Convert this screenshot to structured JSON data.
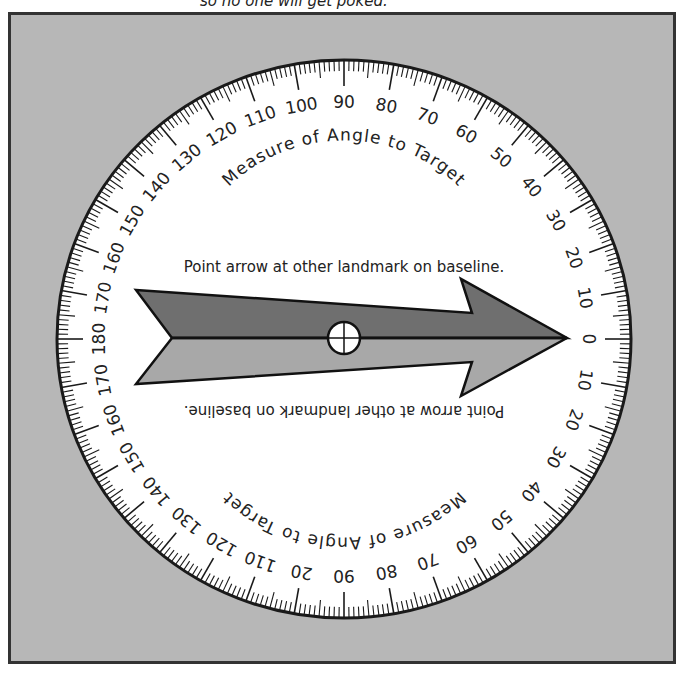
{
  "caption": "so no one will get poked.",
  "dial": {
    "center": [
      344,
      339
    ],
    "radius_x": 287,
    "radius_y": 279,
    "top_labels": [
      "0",
      "10",
      "20",
      "30",
      "40",
      "50",
      "60",
      "70",
      "80",
      "90",
      "100",
      "110",
      "120",
      "130",
      "140",
      "150",
      "160",
      "170",
      "180"
    ],
    "bottom_labels": [
      "0",
      "10",
      "20",
      "30",
      "40",
      "50",
      "60",
      "70",
      "80",
      "90",
      "20",
      "110",
      "120",
      "130",
      "140",
      "150",
      "160",
      "170",
      "180"
    ],
    "arc_text_top": "Measure of Angle to Target",
    "arc_text_bottom": "Measure of Angle to Target"
  },
  "arrow": {
    "instruction_top": "Point arrow at other landmark on baseline.",
    "instruction_bottom": "Point arrow at other landmark on baseline.",
    "upper_color": "#6f6f6f",
    "lower_color": "#a8a8a8"
  },
  "colors": {
    "panel": "#b7b7b7",
    "dial_face": "#ffffff",
    "ink": "#1a1a1a"
  }
}
